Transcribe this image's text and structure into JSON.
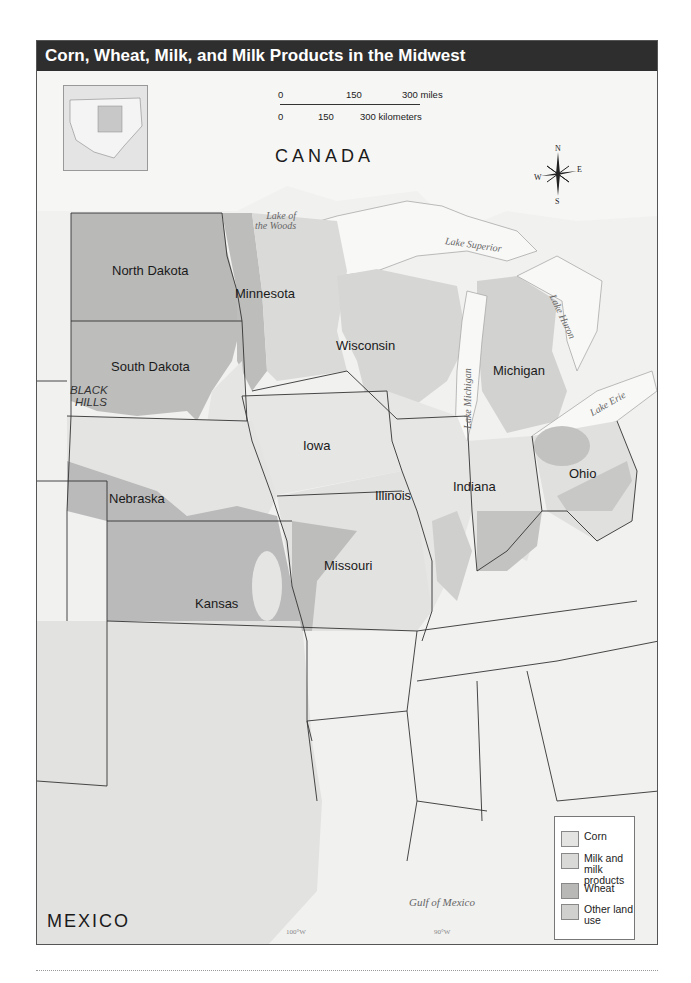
{
  "title": "Corn, Wheat, Milk, and Milk Products in the Midwest",
  "scale_bar": {
    "miles_ticks": [
      "0",
      "150",
      "300 miles"
    ],
    "km_ticks": [
      "0",
      "150",
      "300 kilometers"
    ]
  },
  "compass": {
    "n": "N",
    "s": "S",
    "e": "E",
    "w": "W"
  },
  "countries": {
    "canada": "CANADA",
    "mexico": "MEXICO"
  },
  "states": {
    "north_dakota": "North Dakota",
    "south_dakota": "South Dakota",
    "minnesota": "Minnesota",
    "wisconsin": "Wisconsin",
    "michigan": "Michigan",
    "iowa": "Iowa",
    "nebraska": "Nebraska",
    "kansas": "Kansas",
    "missouri": "Missouri",
    "illinois": "Illinois",
    "indiana": "Indiana",
    "ohio": "Ohio"
  },
  "features": {
    "black_hills_1": "BLACK",
    "black_hills_2": "HILLS"
  },
  "water": {
    "lake_of_woods_1": "Lake of",
    "lake_of_woods_2": "the Woods",
    "lake_superior": "Lake Superior",
    "lake_michigan": "Lake Michigan",
    "lake_huron": "Lake Huron",
    "lake_erie": "Lake Erie",
    "gulf": "Gulf of Mexico"
  },
  "meridians": [
    "100°W",
    "90°W",
    "80°W"
  ],
  "legend": {
    "items": [
      {
        "label": "Corn",
        "color": "#e4e4e3"
      },
      {
        "label_1": "Milk and",
        "label_2": "milk products",
        "color": "#d9d9d8"
      },
      {
        "label": "Wheat",
        "color": "#b8b8b7"
      },
      {
        "label_1": "Other land",
        "label_2": "use",
        "color": "#d0d0cf"
      }
    ]
  },
  "colors": {
    "title_bg": "#2e2e2e",
    "water": "#f8f8f7",
    "other": "#eeeeed",
    "corn": "#e4e4e3",
    "milk": "#d9d9d8",
    "wheat": "#b8b8b7"
  }
}
